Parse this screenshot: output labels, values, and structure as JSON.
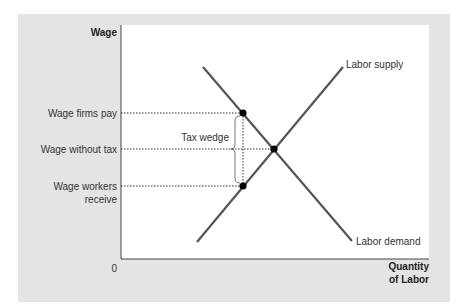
{
  "diagram": {
    "type": "supply-demand-tax-wedge",
    "axes": {
      "y_label": "Wage",
      "x_label_line1": "Quantity",
      "x_label_line2": "of Labor",
      "origin": "0"
    },
    "y_ticks": {
      "firms_pay": "Wage firms pay",
      "without_tax": "Wage without tax",
      "workers_receive_line1": "Wage workers",
      "workers_receive_line2": "receive"
    },
    "curves": {
      "supply": "Labor supply",
      "demand": "Labor demand"
    },
    "annotations": {
      "tax_wedge": "Tax wedge"
    },
    "colors": {
      "panel": "#e4e4e4",
      "plot": "#ffffff",
      "curve": "#555555",
      "point": "#000000"
    }
  }
}
